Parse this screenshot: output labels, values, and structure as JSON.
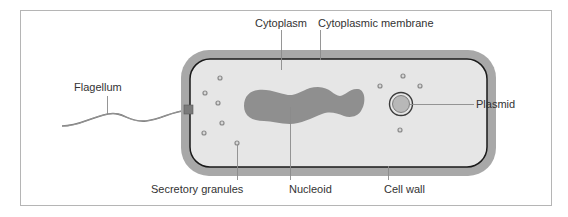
{
  "diagram": {
    "colors": {
      "frame": "#b5b5b5",
      "cell_wall": "#a8a8a8",
      "cytoplasm": "#e6e6e6",
      "membrane": "#1a1a1a",
      "nucleoid": "#8f8f8f",
      "plasmid_fill": "#b8b8b8",
      "granule": "#9a9a9a",
      "leader": "#8a8a8a",
      "text": "#333333"
    },
    "labels": {
      "cytoplasm": "Cytoplasm",
      "cytoplasmic_membrane": "Cytoplasmic membrane",
      "flagellum": "Flagellum",
      "plasmid": "Plasmid",
      "secretory_granules": "Secretory granules",
      "nucleoid": "Nucleoid",
      "cell_wall": "Cell wall"
    }
  }
}
